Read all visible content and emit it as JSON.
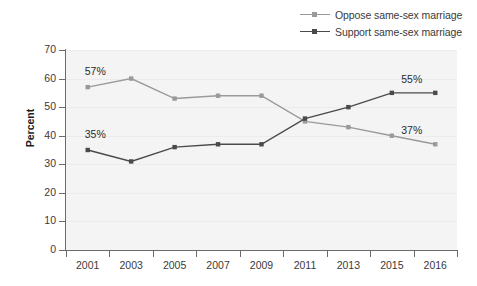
{
  "chart_data": {
    "type": "line",
    "title": "",
    "xlabel": "",
    "ylabel": "Percent",
    "categories": [
      "2001",
      "2003",
      "2005",
      "2007",
      "2009",
      "2011",
      "2013",
      "2015",
      "2016"
    ],
    "ylim": [
      0,
      70
    ],
    "yticks": [
      "0",
      "10",
      "20",
      "30",
      "40",
      "50",
      "60",
      "70"
    ],
    "grid": true,
    "legend_position": "top-right",
    "series": [
      {
        "name": "Oppose same-sex marriage",
        "color": "#9a9a9a",
        "marker": "square",
        "values": [
          57,
          60,
          53,
          54,
          54,
          45,
          43,
          40,
          37
        ]
      },
      {
        "name": "Support same-sex marriage",
        "color": "#4a4a4a",
        "marker": "square",
        "values": [
          35,
          31,
          36,
          37,
          37,
          46,
          50,
          55,
          55
        ]
      }
    ],
    "annotations": [
      {
        "text": "57%",
        "series": "Oppose same-sex marriage",
        "category": "2001",
        "value": 57
      },
      {
        "text": "35%",
        "series": "Support same-sex marriage",
        "category": "2001",
        "value": 35
      },
      {
        "text": "55%",
        "series": "Support same-sex marriage",
        "category": "2016",
        "value": 55
      },
      {
        "text": "37%",
        "series": "Oppose same-sex marriage",
        "category": "2016",
        "value": 37
      }
    ]
  },
  "legend": {
    "items": [
      {
        "label": "Oppose same-sex marriage",
        "color": "#9a9a9a"
      },
      {
        "label": "Support same-sex marriage",
        "color": "#4a4a4a"
      }
    ]
  },
  "axis": {
    "y_title": "Percent"
  },
  "colors": {
    "plot_background": "#f4f4f4",
    "gridline": "#ececec",
    "axis": "#6b6b6b",
    "oppose": "#9a9a9a",
    "support": "#4a4a4a"
  }
}
